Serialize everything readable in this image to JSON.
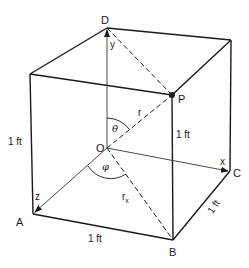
{
  "figure": {
    "type": "unit cube with spherical coordinates",
    "vertices": {
      "D": "D",
      "P": "P",
      "O": "O",
      "A": "A",
      "B": "B",
      "C": "C"
    },
    "axes": {
      "x": "x",
      "y": "y",
      "z": "z"
    },
    "quantities": {
      "r": "r",
      "r_x_base": "r",
      "r_x_sub": "x",
      "theta": "θ",
      "phi": "φ"
    },
    "dimensions": {
      "left_edge": "1 ft",
      "front_right_edge": "1 ft",
      "bottom_edge": "1 ft",
      "right_depth_edge": "1 ft"
    },
    "colors": {
      "line": "#1a1a1a",
      "background": "#ffffff"
    }
  }
}
